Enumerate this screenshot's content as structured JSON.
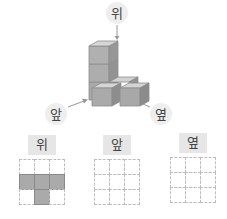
{
  "figure": {
    "top_label": "위",
    "front_label": "앞",
    "side_label": "옆",
    "cube_color": "#b5b5b5"
  },
  "views": [
    {
      "label": "위",
      "cells": [
        [
          0,
          0,
          0
        ],
        [
          1,
          1,
          1
        ],
        [
          0,
          1,
          0
        ]
      ]
    },
    {
      "label": "앞",
      "cells": [
        [
          0,
          0,
          0
        ],
        [
          0,
          0,
          0
        ],
        [
          0,
          0,
          0
        ]
      ]
    },
    {
      "label": "옆",
      "cells": [
        [
          0,
          0,
          0
        ],
        [
          0,
          0,
          0
        ],
        [
          0,
          0,
          0
        ]
      ]
    }
  ]
}
